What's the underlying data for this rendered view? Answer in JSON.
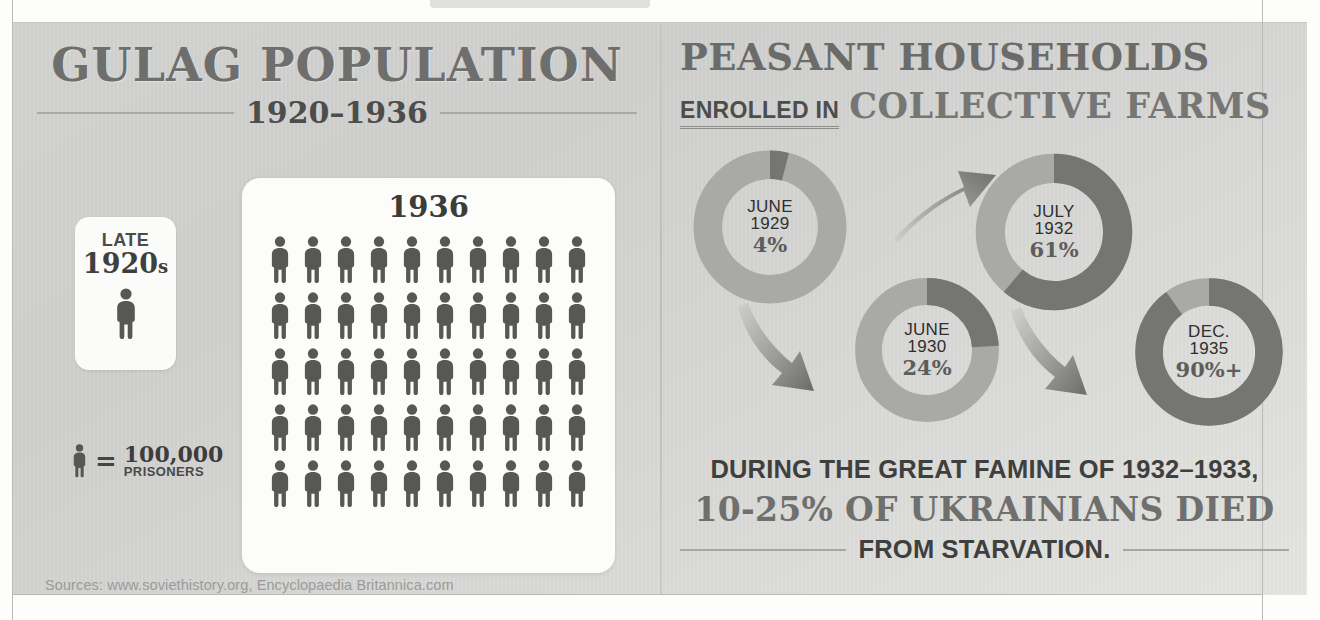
{
  "colors": {
    "paper": "#d5d5d3",
    "card": "#fcfcfb",
    "ink_dark": "#3c3c3b",
    "ink_mid": "#6e6e6d",
    "ink_light": "#9b9b99",
    "donut_dark": "#757574",
    "donut_light": "#a9a9a7",
    "rule": "#a9a9a7"
  },
  "left": {
    "title": "GULAG POPULATION",
    "subtitle_years": "1920–1936",
    "card_1920s": {
      "label_top": "LATE",
      "label_decade": "1920",
      "label_decade_suffix": "s",
      "figure_count": 1,
      "icon": "person-icon"
    },
    "legend": {
      "icon": "person-icon",
      "equals": "=",
      "value": "100,000",
      "unit": "PRISONERS"
    },
    "card_1936": {
      "year": "1936",
      "columns": 10,
      "rows": 5,
      "figure_count": 50
    },
    "sources": "Sources: www.soviethistory.org, Encyclopaedia Britannica.com"
  },
  "right": {
    "title_line1": "PEASANT HOUSEHOLDS",
    "title_line2_small": "ENROLLED IN",
    "title_line2_big": "COLLECTIVE FARMS",
    "donuts": [
      {
        "month": "JUNE",
        "year": "1929",
        "percent_label": "4%",
        "value": 4,
        "icon": "donut-chart-icon"
      },
      {
        "month": "JUNE",
        "year": "1930",
        "percent_label": "24%",
        "value": 24,
        "icon": "donut-chart-icon"
      },
      {
        "month": "JULY",
        "year": "1932",
        "percent_label": "61%",
        "value": 61,
        "icon": "donut-chart-icon"
      },
      {
        "month": "DEC.",
        "year": "1935",
        "percent_label": "90%+",
        "value": 90,
        "icon": "donut-chart-icon"
      }
    ],
    "arrows": [
      {
        "icon": "arrow-up-right-icon",
        "from": "JUNE 1929",
        "to": "JULY 1932"
      },
      {
        "icon": "arrow-down-right-icon",
        "from": "JUNE 1929",
        "to": "JUNE 1930"
      },
      {
        "icon": "arrow-down-right-icon",
        "from": "JUNE 1930",
        "to": "DEC. 1935"
      }
    ],
    "famine": {
      "line1": "DURING THE GREAT FAMINE OF 1932–1933,",
      "line2": "10-25% OF UKRAINIANS DIED",
      "line3": "FROM STARVATION."
    }
  },
  "chart_data": [
    {
      "type": "pie",
      "title": "Peasant households enrolled in collective farms — June 1929",
      "labels": [
        "Enrolled",
        "Not enrolled"
      ],
      "values": [
        4,
        96
      ],
      "unit": "percent",
      "legend": "none",
      "annotations": [
        "JUNE 1929",
        "4%"
      ]
    },
    {
      "type": "pie",
      "title": "Peasant households enrolled in collective farms — June 1930",
      "labels": [
        "Enrolled",
        "Not enrolled"
      ],
      "values": [
        24,
        76
      ],
      "unit": "percent",
      "legend": "none",
      "annotations": [
        "JUNE 1930",
        "24%"
      ]
    },
    {
      "type": "pie",
      "title": "Peasant households enrolled in collective farms — July 1932",
      "labels": [
        "Enrolled",
        "Not enrolled"
      ],
      "values": [
        61,
        39
      ],
      "unit": "percent",
      "legend": "none",
      "annotations": [
        "JULY 1932",
        "61%"
      ]
    },
    {
      "type": "pie",
      "title": "Peasant households enrolled in collective farms — December 1935",
      "labels": [
        "Enrolled",
        "Not enrolled"
      ],
      "values": [
        90,
        10
      ],
      "unit": "percent",
      "legend": "none",
      "annotations": [
        "DEC. 1935",
        "90%+"
      ]
    },
    {
      "type": "bar",
      "title": "Gulag Population 1920–1936",
      "categories": [
        "Late 1920s",
        "1936"
      ],
      "values": [
        100000,
        5000000
      ],
      "ylabel": "Prisoners",
      "xlabel": "",
      "pictogram_unit": 100000,
      "pictogram_counts": [
        1,
        50
      ],
      "grid": false,
      "legend": "none"
    }
  ]
}
